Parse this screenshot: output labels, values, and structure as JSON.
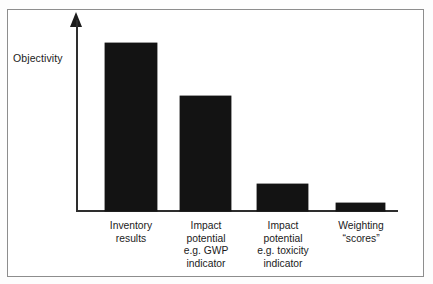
{
  "figure": {
    "kind": "conceptual-bar-chart",
    "y_axis_title": "Objectivity",
    "frame_color": "#8d8d8d",
    "bar_color": "#131313",
    "axis_color": "#2e2e2e",
    "background_color": "#ffffff"
  },
  "chart_data": {
    "type": "bar",
    "title": "",
    "xlabel": "",
    "ylabel": "Objectivity",
    "grid": false,
    "legend": null,
    "ylim": [
      0,
      100
    ],
    "y_axis_has_ticks": false,
    "y_axis_arrow": true,
    "categories": [
      "Inventory results",
      "Impact potential e.g. GWP indicator",
      "Impact potential e.g. toxicity indicator",
      "Weighting “scores”"
    ],
    "category_label_lines": [
      [
        "Inventory",
        "results"
      ],
      [
        "Impact",
        "potential",
        "e.g. GWP",
        "indicator"
      ],
      [
        "Impact",
        "potential",
        "e.g. toxicity",
        "indicator"
      ],
      [
        "Weighting",
        "“scores”"
      ]
    ],
    "values": [
      100,
      68,
      16,
      5
    ],
    "annotations": []
  },
  "bars": [
    {
      "name": "bar-inventory-results",
      "value": 100,
      "left_px": 105,
      "width_px": 52,
      "top_px": 43,
      "height_px": 168,
      "label": "Inventory\nresults",
      "label_left_px": 85,
      "label_top_px": 220,
      "label_width_px": 92
    },
    {
      "name": "bar-impact-potential-gwp",
      "value": 68,
      "left_px": 180,
      "width_px": 51,
      "top_px": 96,
      "height_px": 115,
      "label": "Impact\npotential\ne.g. GWP\nindicator",
      "label_left_px": 160,
      "label_top_px": 220,
      "label_width_px": 92
    },
    {
      "name": "bar-impact-potential-toxicity",
      "value": 16,
      "left_px": 257,
      "width_px": 51,
      "top_px": 184,
      "height_px": 27,
      "label": "Impact\npotential\ne.g. toxicity\nindicator",
      "label_left_px": 237,
      "label_top_px": 220,
      "label_width_px": 92
    },
    {
      "name": "bar-weighting-scores",
      "value": 5,
      "left_px": 336,
      "width_px": 49,
      "top_px": 203,
      "height_px": 8,
      "label": "Weighting\n“scores”",
      "label_left_px": 315,
      "label_top_px": 220,
      "label_width_px": 92
    }
  ]
}
